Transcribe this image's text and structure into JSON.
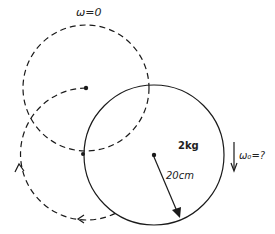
{
  "labels": {
    "omega_zero": "ω=0",
    "mass": "2kg",
    "radius": "20cm",
    "omega_unknown": "ω₀=?"
  },
  "colors": {
    "stroke": "#1a1a1a",
    "background": "#ffffff"
  }
}
